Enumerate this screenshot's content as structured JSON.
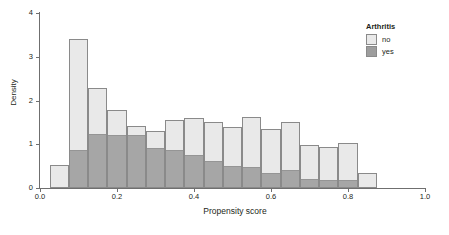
{
  "chart_data": {
    "type": "bar",
    "title": "",
    "subtitle": "",
    "xlabel": "Propensity score",
    "ylabel": "Density",
    "xlim": [
      0.0,
      1.0
    ],
    "ylim": [
      0,
      4
    ],
    "grid": false,
    "legend_position": "right",
    "legend_title": "Arthritis",
    "bin_width": 0.05,
    "bin_starts": [
      0.025,
      0.075,
      0.125,
      0.175,
      0.225,
      0.275,
      0.325,
      0.375,
      0.425,
      0.475,
      0.525,
      0.575,
      0.625,
      0.675,
      0.725,
      0.775,
      0.825
    ],
    "bin_centers": [
      0.05,
      0.1,
      0.15,
      0.2,
      0.25,
      0.3,
      0.35,
      0.4,
      0.45,
      0.5,
      0.55,
      0.6,
      0.65,
      0.7,
      0.75,
      0.8,
      0.85
    ],
    "series": [
      {
        "name": "no",
        "color": "#e9e9e9",
        "values": [
          0.52,
          3.4,
          2.29,
          1.78,
          1.42,
          1.3,
          1.56,
          1.6,
          1.5,
          1.4,
          1.63,
          1.35,
          1.5,
          0.98,
          0.93,
          1.02,
          0.34
        ]
      },
      {
        "name": "yes",
        "color": "#9d9d9d",
        "values": [
          0.0,
          0.86,
          1.23,
          1.22,
          1.22,
          0.92,
          0.86,
          0.75,
          0.62,
          0.51,
          0.47,
          0.34,
          0.42,
          0.2,
          0.18,
          0.18,
          0.0
        ]
      }
    ],
    "xticks": [
      {
        "value": 0.0,
        "label": "0.0"
      },
      {
        "value": 0.2,
        "label": "0.2"
      },
      {
        "value": 0.4,
        "label": "0.4"
      },
      {
        "value": 0.6,
        "label": "0.6"
      },
      {
        "value": 0.8,
        "label": "0.8"
      },
      {
        "value": 1.0,
        "label": "1.0"
      }
    ],
    "yticks": [
      {
        "value": 0,
        "label": "0"
      },
      {
        "value": 1,
        "label": "1"
      },
      {
        "value": 2,
        "label": "2"
      },
      {
        "value": 3,
        "label": "3"
      },
      {
        "value": 4,
        "label": "4"
      }
    ]
  },
  "legend": {
    "title": "Arthritis",
    "entries": [
      {
        "label": "no",
        "color": "#e9e9e9"
      },
      {
        "label": "yes",
        "color": "#9d9d9d"
      }
    ]
  },
  "axes": {
    "x_title": "Propensity score",
    "y_title": "Density"
  }
}
